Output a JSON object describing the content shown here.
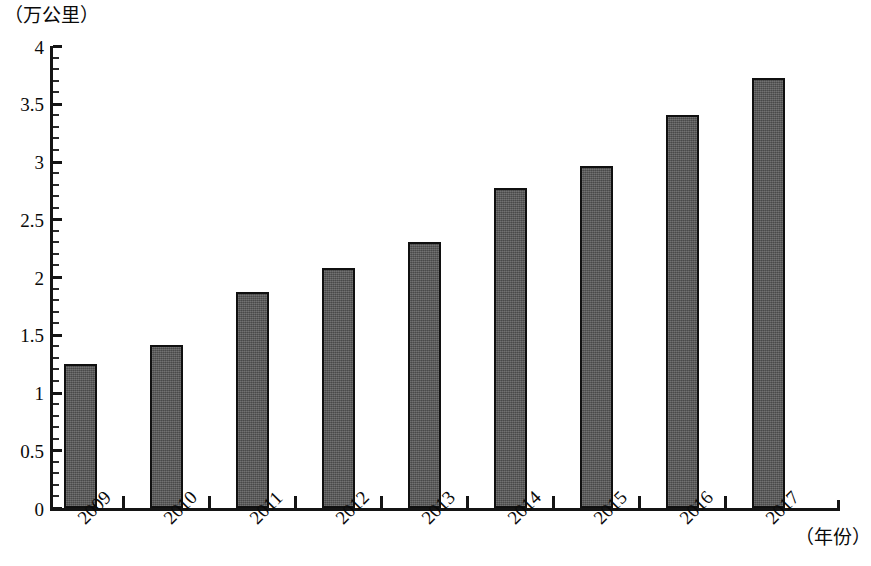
{
  "chart_data": {
    "type": "bar",
    "title": "",
    "subtitle": "",
    "xlabel": "（年份）",
    "ylabel": "（万公里）",
    "categories": [
      "2009",
      "2010",
      "2011",
      "2012",
      "2013",
      "2014",
      "2015",
      "2016",
      "2017"
    ],
    "values": [
      1.25,
      1.41,
      1.87,
      2.08,
      2.3,
      2.77,
      2.96,
      3.4,
      3.72
    ],
    "series": [
      {
        "name": "",
        "values": [
          1.25,
          1.41,
          1.87,
          2.08,
          2.3,
          2.77,
          2.96,
          3.4,
          3.72
        ]
      }
    ],
    "ylim": [
      0,
      4
    ],
    "yticks": [
      "0",
      "0.5",
      "1",
      "1.5",
      "2",
      "2.5",
      "3",
      "3.5",
      "4"
    ],
    "ytick_values": [
      0,
      0.5,
      1,
      1.5,
      2,
      2.5,
      3,
      3.5,
      4
    ],
    "grid": false,
    "legend": null,
    "bar_color": "#585858",
    "bar_border_color": "#101010",
    "axis_color": "#141414",
    "background_color": "#ffffff"
  },
  "axis": {
    "y_unit_label": "（万公里）",
    "x_axis_title": "（年份）"
  }
}
